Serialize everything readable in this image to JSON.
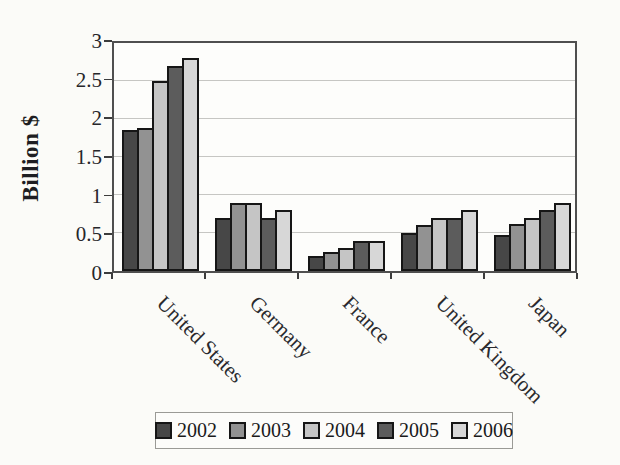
{
  "chart_data": {
    "type": "bar",
    "title": "",
    "xlabel": "",
    "ylabel": "Billion $",
    "categories": [
      "United States",
      "Germany",
      "France",
      "United Kingdom",
      "Japan"
    ],
    "series": [
      {
        "name": "2002",
        "color": "#474747",
        "values": [
          1.85,
          0.7,
          0.2,
          0.5,
          0.48
        ]
      },
      {
        "name": "2003",
        "color": "#929292",
        "values": [
          1.88,
          0.9,
          0.25,
          0.6,
          0.62
        ]
      },
      {
        "name": "2004",
        "color": "#c5c5c5",
        "values": [
          2.5,
          0.9,
          0.3,
          0.7,
          0.7
        ]
      },
      {
        "name": "2005",
        "color": "#5c5c5c",
        "values": [
          2.7,
          0.7,
          0.4,
          0.7,
          0.8
        ]
      },
      {
        "name": "2006",
        "color": "#d7d7d7",
        "values": [
          2.8,
          0.8,
          0.4,
          0.8,
          0.9
        ]
      }
    ],
    "ylim": [
      0,
      3
    ],
    "ytick_step": 0.5,
    "yticks": [
      {
        "value": 3,
        "label": "3"
      },
      {
        "value": 2.5,
        "label": "2.5"
      },
      {
        "value": 2,
        "label": "2"
      },
      {
        "value": 1.5,
        "label": "1.5"
      },
      {
        "value": 1,
        "label": "1"
      },
      {
        "value": 0.5,
        "label": "0.5"
      },
      {
        "value": 0,
        "label": "0"
      }
    ],
    "grid": true,
    "legend_position": "bottom",
    "plot_border_color": "#4f4f4f",
    "gridline_color": "#c6c6c3",
    "bar_border_color": "#161616"
  }
}
